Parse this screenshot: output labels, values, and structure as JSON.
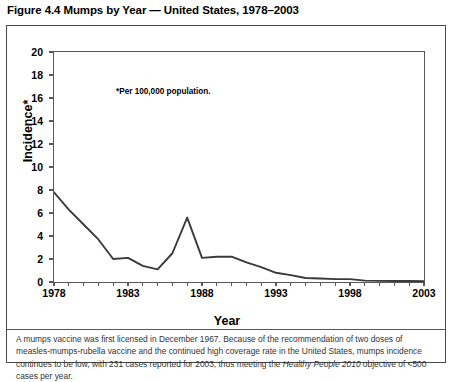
{
  "figure": {
    "title": "Figure 4.4 Mumps by Year — United States, 1978–2003",
    "annotation": "*Per 100,000 population."
  },
  "footnote": {
    "part1": "A mumps vaccine was first licensed in December 1967.  Because of the recommendation of two doses of measles-mumps-rubella vaccine and the continued high coverage rate in the United States, mumps incidence continues to be low, with 231 cases reported for 2003, thus meeting the ",
    "italic": "Healthy People 2010",
    "part2": " objective of <500 cases per year."
  },
  "colors": {
    "line": "#3a3a3c",
    "frame": "#58585a",
    "outer_border": "#4a4a4a",
    "text": "#000000",
    "footnote_text": "#333333",
    "background": "#ffffff"
  },
  "chart_data": {
    "type": "line",
    "title": "Figure 4.4 Mumps by Year — United States, 1978–2003",
    "xlabel": "Year",
    "ylabel": "Incidence*",
    "annotation": "*Per 100,000 population.",
    "xlim": [
      1978,
      2003
    ],
    "ylim": [
      0,
      20
    ],
    "ytick_values": [
      0,
      2,
      4,
      6,
      8,
      10,
      12,
      14,
      16,
      18,
      20
    ],
    "ytick_labels": [
      "0",
      "2",
      "4",
      "6",
      "8",
      "10",
      "12",
      "14",
      "16",
      "18",
      "20"
    ],
    "xtick_values": [
      1978,
      1983,
      1988,
      1993,
      1998,
      2003
    ],
    "xtick_labels": [
      "1978",
      "1983",
      "1988",
      "1993",
      "1998",
      "2003"
    ],
    "xtick_minor_every": 1,
    "grid": false,
    "legend": false,
    "x": [
      1978,
      1979,
      1980,
      1981,
      1982,
      1983,
      1984,
      1985,
      1986,
      1987,
      1988,
      1989,
      1990,
      1991,
      1992,
      1993,
      1994,
      1995,
      1996,
      1997,
      1998,
      1999,
      2000,
      2001,
      2002,
      2003
    ],
    "values": [
      7.8,
      6.3,
      5.0,
      3.7,
      2.0,
      2.1,
      1.4,
      1.1,
      2.5,
      5.6,
      2.1,
      2.2,
      2.2,
      1.7,
      1.3,
      0.8,
      0.6,
      0.35,
      0.3,
      0.25,
      0.25,
      0.12,
      0.1,
      0.09,
      0.09,
      0.08
    ],
    "series": [
      {
        "name": "Mumps incidence per 100,000 population",
        "values": [
          7.8,
          6.3,
          5.0,
          3.7,
          2.0,
          2.1,
          1.4,
          1.1,
          2.5,
          5.6,
          2.1,
          2.2,
          2.2,
          1.7,
          1.3,
          0.8,
          0.6,
          0.35,
          0.3,
          0.25,
          0.25,
          0.12,
          0.1,
          0.09,
          0.09,
          0.08
        ]
      }
    ]
  }
}
